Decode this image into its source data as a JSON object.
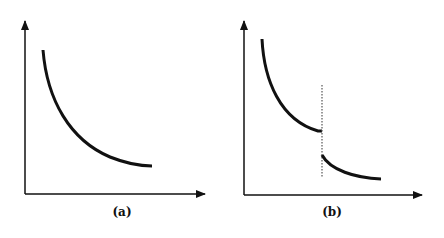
{
  "figure": {
    "panels": [
      {
        "id": "a",
        "label": "(a)",
        "description": "Smoothly decreasing convex curve",
        "axes": {
          "x_arrow": true,
          "y_arrow": true,
          "tick_labels": []
        }
      },
      {
        "id": "b",
        "label": "(b)",
        "description": "Decreasing convex curve with a discontinuous downward jump at a dotted vertical line",
        "axes": {
          "x_arrow": true,
          "y_arrow": true,
          "tick_labels": []
        },
        "discontinuity_marker": "dotted-vertical-line"
      }
    ],
    "colors": {
      "curve": "#111111",
      "axis": "#111111",
      "dotted_line": "#555555",
      "background": "#ffffff"
    }
  }
}
